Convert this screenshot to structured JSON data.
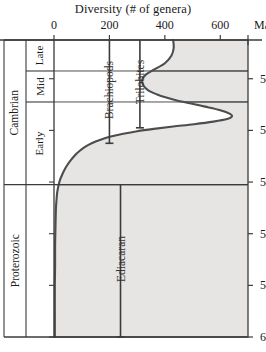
{
  "chart_data": {
    "type": "line",
    "title": "Diversity (# of genera)",
    "xlabel": "Diversity (# of genera)",
    "ylabel": "Ma",
    "orientation": "vertical-time-axis",
    "xlim": [
      0,
      700
    ],
    "ylim": [
      600,
      485
    ],
    "x_ticks": [
      0,
      200,
      400,
      600
    ],
    "x_tick_labels": [
      "0",
      "200",
      "400",
      "600"
    ],
    "y_ticks": [
      500,
      520,
      540,
      560,
      580,
      600
    ],
    "y_tick_labels": [
      "500",
      "520",
      "540",
      "560",
      "580",
      "600"
    ],
    "y_axis_unit": "Ma",
    "grid": false,
    "legend": "none",
    "series": [
      {
        "name": "Total genera diversity",
        "points": [
          [
            430,
            485.0
          ],
          [
            432,
            488.0
          ],
          [
            424,
            491.0
          ],
          [
            400,
            494.0
          ],
          [
            360,
            496.5
          ],
          [
            330,
            498.5
          ],
          [
            318,
            500.5
          ],
          [
            322,
            502.5
          ],
          [
            340,
            504.5
          ],
          [
            370,
            506.0
          ],
          [
            405,
            507.3
          ],
          [
            440,
            508.3
          ],
          [
            490,
            509.5
          ],
          [
            545,
            510.8
          ],
          [
            600,
            512.2
          ],
          [
            635,
            513.6
          ],
          [
            642,
            514.6
          ],
          [
            625,
            515.6
          ],
          [
            575,
            516.6
          ],
          [
            505,
            517.6
          ],
          [
            430,
            518.5
          ],
          [
            360,
            519.4
          ],
          [
            300,
            520.3
          ],
          [
            250,
            521.3
          ],
          [
            205,
            522.4
          ],
          [
            168,
            523.6
          ],
          [
            138,
            524.9
          ],
          [
            112,
            526.4
          ],
          [
            92,
            528.0
          ],
          [
            74,
            529.8
          ],
          [
            60,
            531.6
          ],
          [
            48,
            533.4
          ],
          [
            38,
            535.2
          ],
          [
            30,
            537.0
          ],
          [
            23,
            538.8
          ],
          [
            18,
            540.6
          ],
          [
            14,
            542.5
          ],
          [
            11,
            544.5
          ],
          [
            9,
            547.0
          ],
          [
            7,
            550.0
          ],
          [
            6,
            554.0
          ],
          [
            5,
            559.0
          ],
          [
            4,
            565.0
          ],
          [
            4,
            572.0
          ],
          [
            3,
            580.0
          ],
          [
            3,
            590.0
          ],
          [
            3,
            600.0
          ]
        ]
      }
    ],
    "range_bars": [
      {
        "label": "Brachiopods",
        "x_value": 200,
        "from_age": 485.0,
        "to_age": 525.0
      },
      {
        "label": "Trilobites",
        "x_value": 310,
        "from_age": 485.0,
        "to_age": 519.0
      },
      {
        "label": "Ediacaran",
        "x_value": 240,
        "from_age": 541.0,
        "to_age": 600.0
      }
    ],
    "time_divisions": {
      "eras": [
        {
          "label": "Cambrian",
          "from_age": 485.0,
          "to_age": 541.0
        },
        {
          "label": "Proterozoic",
          "from_age": 541.0,
          "to_age": 600.0
        }
      ],
      "epochs": [
        {
          "label": "Late",
          "from_age": 485.0,
          "to_age": 497.0
        },
        {
          "label": "Mid",
          "from_age": 497.0,
          "to_age": 509.0
        },
        {
          "label": "Early",
          "from_age": 509.0,
          "to_age": 541.0
        }
      ]
    },
    "boundary_ages": [
      497.0,
      509.0,
      541.0
    ],
    "colors": {
      "plot_background": "#e6e5e3",
      "curve": "#4d4d4d",
      "axis": "#3b3b3b",
      "range_bar": "#3b3b3b",
      "text": "#1a1a1a",
      "page_background": "#ffffff"
    }
  }
}
